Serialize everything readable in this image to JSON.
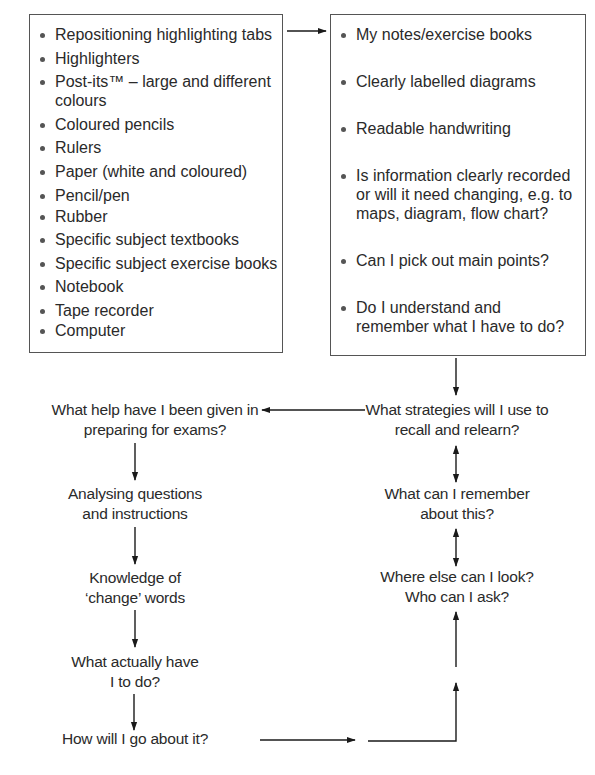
{
  "resources_box": {
    "items": [
      "Repositioning highlighting tabs",
      "Highlighters",
      "Post-its™ – large and different colours",
      "Coloured pencils",
      "Rulers",
      "Paper (white and coloured)",
      "Pencil/pen",
      "Rubber",
      "Specific subject textbooks",
      "Specific subject exercise books",
      "Notebook",
      "Tape recorder",
      "Computer"
    ]
  },
  "checklist_box": {
    "items": [
      "My notes/exercise books",
      "Clearly labelled diagrams",
      "Readable handwriting",
      "Is information clearly recorded or will it need changing, e.g. to maps, diagram, flow chart?",
      "Can I pick out main points?",
      "Do I understand and remember what I have to do?"
    ]
  },
  "left_flow": {
    "help": "What help have I been given in preparing for exams?",
    "analysing": "Analysing questions and instructions",
    "knowledge": "Knowledge of ‘change’ words",
    "actually": "What actually have I to do?",
    "how": "How will I go about it?"
  },
  "right_flow": {
    "strategies": "What strategies will I use to recall and relearn?",
    "remember": "What can I remember about this?",
    "where": "Where else can I look? Who can I ask?"
  }
}
